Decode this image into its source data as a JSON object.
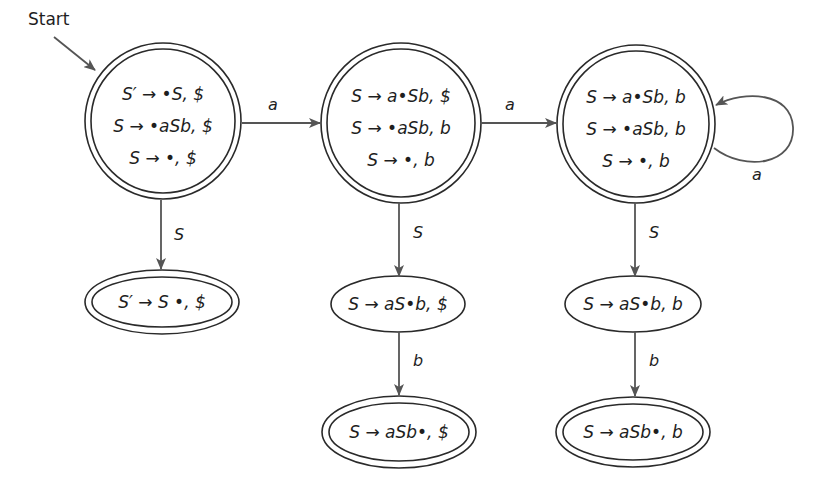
{
  "diagram": {
    "type": "LR(1) automaton (canonical item sets)",
    "start_label": "Start",
    "states": [
      {
        "id": "I0",
        "shape": "double-circle",
        "items": [
          "S′ → •S, $",
          "S → •aSb, $",
          "S → •, $"
        ]
      },
      {
        "id": "I1",
        "shape": "double-ellipse",
        "items": [
          "S′ → S •, $"
        ]
      },
      {
        "id": "I2",
        "shape": "double-circle",
        "items": [
          "S → a•Sb, $",
          "S → •aSb, b",
          "S → •, b"
        ]
      },
      {
        "id": "I3",
        "shape": "ellipse",
        "items": [
          "S → aS•b, $"
        ]
      },
      {
        "id": "I4",
        "shape": "double-ellipse",
        "items": [
          "S → aSb•, $"
        ]
      },
      {
        "id": "I5",
        "shape": "double-circle",
        "items": [
          "S → a•Sb, b",
          "S → •aSb, b",
          "S → •, b"
        ]
      },
      {
        "id": "I6",
        "shape": "ellipse",
        "items": [
          "S → aS•b, b"
        ]
      },
      {
        "id": "I7",
        "shape": "double-ellipse",
        "items": [
          "S → aSb•, b"
        ]
      }
    ],
    "transitions": [
      {
        "from": "I0",
        "to": "I2",
        "label": "a"
      },
      {
        "from": "I2",
        "to": "I5",
        "label": "a"
      },
      {
        "from": "I5",
        "to": "I5",
        "label": "a"
      },
      {
        "from": "I0",
        "to": "I1",
        "label": "S"
      },
      {
        "from": "I2",
        "to": "I3",
        "label": "S"
      },
      {
        "from": "I3",
        "to": "I4",
        "label": "b"
      },
      {
        "from": "I5",
        "to": "I6",
        "label": "S"
      },
      {
        "from": "I6",
        "to": "I7",
        "label": "b"
      }
    ]
  }
}
